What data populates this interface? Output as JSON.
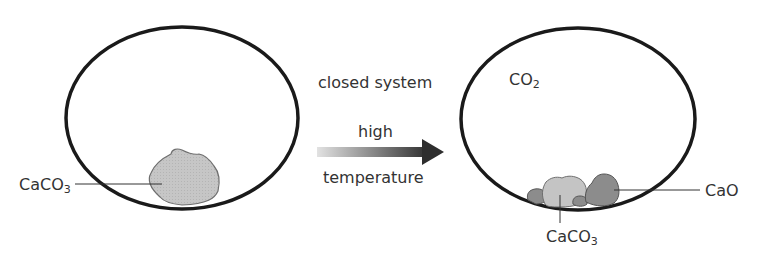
{
  "diagram": {
    "left_container": {
      "label": "CaCO",
      "label_sub": "3"
    },
    "arrow": {
      "top_text": "closed system",
      "mid_text": "high",
      "bottom_text": "temperature"
    },
    "right_container": {
      "gas_label": "CO",
      "gas_label_sub": "2",
      "solid_label_1": "CaCO",
      "solid_label_1_sub": "3",
      "solid_label_2": "CaO"
    },
    "colors": {
      "outline": "#1a1a1a",
      "caco3_fill": "#c4c4c4",
      "cao_fill": "#8a8a8a",
      "arrow_start": "#e0e0e0",
      "arrow_end": "#2e2e2e"
    }
  }
}
